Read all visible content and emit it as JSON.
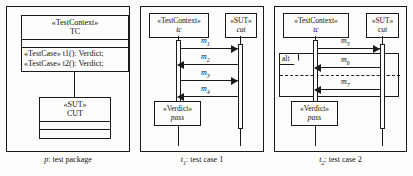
{
  "figure": {
    "panels": [
      {
        "id": "package",
        "caption_prefix": "p",
        "caption_text": ": test package",
        "classes": [
          {
            "stereotype": "«TestContext»",
            "name": "TC",
            "operations": [
              "«TestCase» t1(): Verdict;",
              "«TestCase» t2(): Verdict;"
            ]
          },
          {
            "stereotype": "«SUT»",
            "name": "CUT",
            "operations": []
          }
        ]
      },
      {
        "id": "testcase1",
        "caption_prefix": "t",
        "caption_sub": "1",
        "caption_text": ": test case 1",
        "lifelines": [
          {
            "stereotype": "«TestContext»",
            "name": "tc"
          },
          {
            "stereotype": "«SUT»",
            "name": "cut"
          }
        ],
        "messages": [
          {
            "label": "m",
            "sub": "1",
            "direction": "right"
          },
          {
            "label": "m",
            "sub": "2",
            "direction": "left"
          },
          {
            "label": "m",
            "sub": "3",
            "direction": "right"
          },
          {
            "label": "m",
            "sub": "4",
            "direction": "left"
          }
        ],
        "verdict": {
          "stereotype": "«Verdict»",
          "value": "pass"
        }
      },
      {
        "id": "testcase2",
        "caption_prefix": "t",
        "caption_sub": "2",
        "caption_text": ": test case 2",
        "lifelines": [
          {
            "stereotype": "«TestContext»",
            "name": "tc"
          },
          {
            "stereotype": "«SUT»",
            "name": "cut"
          }
        ],
        "messages": [
          {
            "label": "m",
            "sub": "5",
            "direction": "right"
          },
          {
            "label": "m",
            "sub": "6",
            "direction": "left"
          },
          {
            "label": "m",
            "sub": "7",
            "direction": "left"
          }
        ],
        "fragment": {
          "operator": "alt"
        },
        "verdict": {
          "stereotype": "«Verdict»",
          "value": "pass"
        }
      }
    ]
  },
  "colors": {
    "line": "#1a1a1a",
    "background": "#fdfdfb"
  }
}
